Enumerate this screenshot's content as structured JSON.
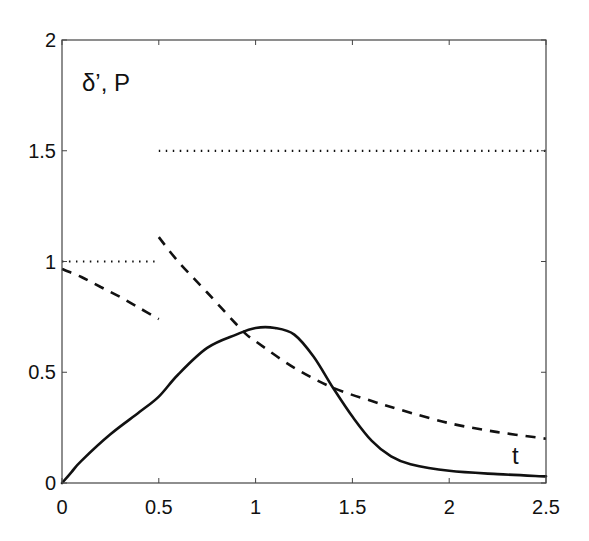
{
  "chart_data": {
    "type": "line",
    "title": "",
    "xlabel": "t",
    "ylabel": "δ’, P",
    "xlim": [
      0,
      2.5
    ],
    "ylim": [
      0,
      2
    ],
    "grid": false,
    "legend": null,
    "x_ticks": [
      0,
      0.5,
      1,
      1.5,
      2,
      2.5
    ],
    "x_tick_labels": [
      "0",
      "0.5",
      "1",
      "1.5",
      "2",
      "2.5"
    ],
    "y_ticks": [
      0,
      0.5,
      1,
      1.5,
      2
    ],
    "y_tick_labels": [
      "0",
      "0.5",
      "1",
      "1.5",
      "2"
    ],
    "annotations": [
      {
        "text": "δ’, P",
        "x": 0.1,
        "y": 1.8
      },
      {
        "text": "t",
        "x": 2.33,
        "y": 0.12
      }
    ],
    "series": [
      {
        "name": "P (dotted)",
        "style": "dotted",
        "segments": [
          {
            "x": [
              0,
              0.5
            ],
            "y": [
              1.0,
              1.0
            ]
          },
          {
            "x": [
              0.5,
              2.5
            ],
            "y": [
              1.5,
              1.5
            ]
          }
        ]
      },
      {
        "name": "dashed",
        "style": "dashed",
        "segments": [
          {
            "x": [
              0,
              0.1,
              0.2,
              0.3,
              0.4,
              0.5
            ],
            "y": [
              0.966,
              0.93,
              0.885,
              0.84,
              0.79,
              0.74
            ]
          },
          {
            "x": [
              0.5,
              0.6,
              0.75,
              0.93,
              1.0,
              1.2,
              1.4,
              1.6,
              1.75,
              2.0,
              2.25,
              2.5
            ],
            "y": [
              1.11,
              1.0,
              0.86,
              0.69,
              0.64,
              0.52,
              0.43,
              0.37,
              0.33,
              0.27,
              0.23,
              0.2
            ]
          }
        ]
      },
      {
        "name": "solid",
        "style": "solid",
        "segments": [
          {
            "x": [
              0,
              0.05,
              0.1,
              0.25,
              0.4,
              0.5,
              0.6,
              0.75,
              0.9,
              1.0,
              1.1,
              1.2,
              1.3,
              1.4,
              1.5,
              1.6,
              1.7,
              1.8,
              2.0,
              2.25,
              2.5
            ],
            "y": [
              0,
              0.05,
              0.1,
              0.22,
              0.32,
              0.39,
              0.49,
              0.61,
              0.67,
              0.7,
              0.7,
              0.67,
              0.57,
              0.43,
              0.3,
              0.19,
              0.12,
              0.085,
              0.055,
              0.04,
              0.03
            ]
          }
        ]
      }
    ]
  }
}
